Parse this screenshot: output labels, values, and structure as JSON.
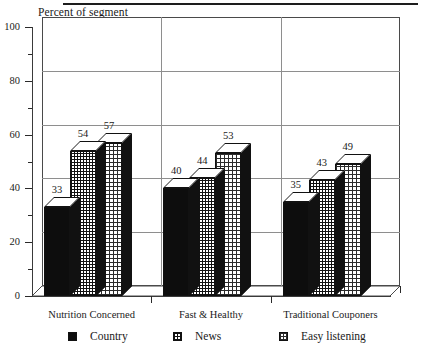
{
  "chart_data": {
    "type": "bar",
    "title": "",
    "subtitle": "",
    "xlabel": "",
    "ylabel": "Percent of segment",
    "ylim": [
      0,
      100
    ],
    "ytick_labels": [
      "0",
      "20",
      "40",
      "60",
      "80",
      "100"
    ],
    "ytick_values": [
      0,
      20,
      40,
      60,
      80,
      100
    ],
    "yminor_step": 10,
    "grid": "horizontal-and-group-separators",
    "legend_position": "bottom",
    "categories": [
      "Nutrition Concerned",
      "Fast & Healthy",
      "Traditional Couponers"
    ],
    "series": [
      {
        "name": "Country",
        "pattern": "solid",
        "values": [
          33,
          40,
          35
        ]
      },
      {
        "name": "News",
        "pattern": "grid",
        "values": [
          54,
          44,
          43
        ]
      },
      {
        "name": "Easy listening",
        "pattern": "dots",
        "values": [
          57,
          53,
          49
        ]
      }
    ],
    "data_labels": [
      [
        "33",
        "54",
        "57"
      ],
      [
        "40",
        "44",
        "53"
      ],
      [
        "35",
        "43",
        "49"
      ]
    ],
    "style": "3d-grouped-column",
    "colors": {
      "background": "#ffffff",
      "axis": "#2a2a2a",
      "gridline": "#8e8e8e",
      "series_solid": "#0d0d0d",
      "series_grid": "#111111",
      "series_dots": "#2b2b2b",
      "text": "#1a1a1a"
    }
  },
  "legend": {
    "items": [
      {
        "label": "Country"
      },
      {
        "label": "News"
      },
      {
        "label": "Easy listening"
      }
    ]
  }
}
